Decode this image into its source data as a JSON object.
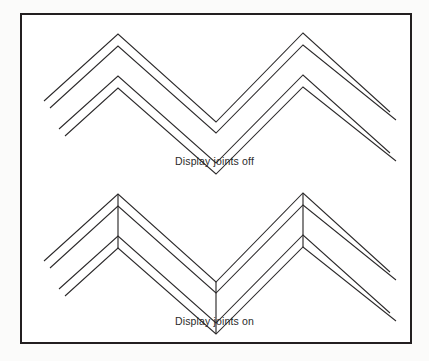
{
  "figure": {
    "background_color": "#fbfbfa",
    "panel_color": "#ffffff",
    "border_color": "#231f20",
    "stroke_color": "#2c2a2b",
    "captions": {
      "top": "Display joints off",
      "bottom": "Display joints on"
    }
  },
  "diagram_data": {
    "type": "line-drawing",
    "description": "Two chevron / zigzag polyline band drawings comparing rendering with joints hidden versus joints shown",
    "panels": [
      {
        "id": "joints-off",
        "caption": "Display joints off",
        "joints_visible": false,
        "bands": [
          {
            "id": "upper-band",
            "outer_polyline": [
              [
                44,
                101
              ],
              [
                118,
                34
              ],
              [
                216,
                122
              ]
            ],
            "inner_polyline": [
              [
                50,
                108
              ],
              [
                118,
                46
              ],
              [
                216,
                133
              ]
            ],
            "outer_polyline_right": [
              [
                118,
                34
              ],
              [
                216,
                122
              ],
              [
                216,
                122
              ]
            ],
            "points_outer": [
              [
                44,
                101
              ],
              [
                118,
                34
              ],
              [
                216,
                122
              ],
              [
                303,
                33
              ],
              [
                390,
                112
              ]
            ],
            "points_inner": [
              [
                50,
                108
              ],
              [
                118,
                46
              ],
              [
                216,
                133
              ],
              [
                303,
                45
              ],
              [
                396,
                120
              ]
            ]
          },
          {
            "id": "lower-band",
            "points_outer": [
              [
                59,
                129
              ],
              [
                118,
                76
              ],
              [
                216,
                163
              ],
              [
                303,
                75
              ],
              [
                390,
                153
              ]
            ],
            "points_inner": [
              [
                65,
                136
              ],
              [
                118,
                88
              ],
              [
                216,
                174
              ],
              [
                303,
                87
              ],
              [
                396,
                161
              ]
            ]
          }
        ]
      },
      {
        "id": "joints-on",
        "caption": "Display joints on",
        "joints_visible": true,
        "bands": [
          {
            "id": "upper-band",
            "points_outer": [
              [
                44,
                261
              ],
              [
                118,
                194
              ],
              [
                216,
                282
              ],
              [
                303,
                193
              ],
              [
                390,
                272
              ]
            ],
            "points_inner": [
              [
                50,
                268
              ],
              [
                118,
                206
              ],
              [
                216,
                293
              ],
              [
                303,
                205
              ],
              [
                396,
                280
              ]
            ]
          },
          {
            "id": "lower-band",
            "points_outer": [
              [
                59,
                289
              ],
              [
                118,
                236
              ],
              [
                216,
                323
              ],
              [
                303,
                235
              ],
              [
                390,
                313
              ]
            ],
            "points_inner": [
              [
                65,
                296
              ],
              [
                118,
                248
              ],
              [
                216,
                334
              ],
              [
                303,
                247
              ],
              [
                396,
                321
              ]
            ]
          }
        ],
        "joint_segments": [
          [
            [
              118,
              194
            ],
            [
              118,
              248
            ]
          ],
          [
            [
              216,
              282
            ],
            [
              216,
              334
            ]
          ],
          [
            [
              303,
              193
            ],
            [
              303,
              247
            ]
          ]
        ]
      }
    ]
  }
}
